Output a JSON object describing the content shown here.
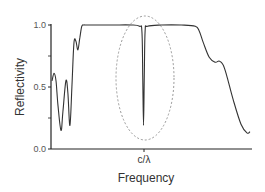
{
  "chart_data": {
    "type": "line",
    "title": "",
    "xlabel": "Frequency",
    "ylabel": "Reflectivity",
    "ylim": [
      0.0,
      1.0
    ],
    "yticks": [
      "0.0",
      "0.5",
      "1.0"
    ],
    "xticks": [
      "c/λ"
    ],
    "xtick_position": 0.46,
    "grid": false,
    "legend": null,
    "series": [
      {
        "name": "Reflectivity spectrum",
        "color": "#333333",
        "x": [
          0.0,
          0.01,
          0.02,
          0.03,
          0.045,
          0.055,
          0.07,
          0.08,
          0.09,
          0.1,
          0.11,
          0.12,
          0.13,
          0.14,
          0.15,
          0.16,
          0.17,
          0.2,
          0.3,
          0.4,
          0.44,
          0.452,
          0.456,
          0.46,
          0.464,
          0.468,
          0.48,
          0.55,
          0.65,
          0.72,
          0.74,
          0.76,
          0.79,
          0.82,
          0.84,
          0.86,
          0.88,
          0.91,
          0.95,
          0.98,
          0.995
        ],
        "values": [
          0.55,
          0.61,
          0.55,
          0.35,
          0.15,
          0.3,
          0.55,
          0.45,
          0.19,
          0.5,
          0.85,
          0.87,
          0.8,
          0.9,
          0.99,
          1.0,
          1.0,
          1.0,
          1.0,
          1.0,
          0.99,
          0.95,
          0.6,
          0.19,
          0.6,
          0.95,
          0.99,
          1.0,
          1.0,
          0.99,
          0.95,
          0.86,
          0.74,
          0.7,
          0.71,
          0.68,
          0.58,
          0.4,
          0.2,
          0.13,
          0.14
        ]
      }
    ],
    "annotations": [
      {
        "type": "dashed-ellipse",
        "center_x": 0.46,
        "center_y": 0.5,
        "label": ""
      }
    ]
  }
}
